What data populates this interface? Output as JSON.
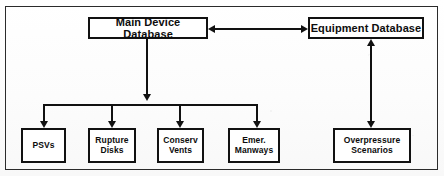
{
  "diagram": {
    "frame_color": "#2b2b2b",
    "line_color": "#111111",
    "background_color": "#fdfdfd",
    "nodes": [
      {
        "id": "main_device_database",
        "label": "Main Device Database"
      },
      {
        "id": "equipment_database",
        "label": "Equipment Database"
      },
      {
        "id": "psvs",
        "label": "PSVs"
      },
      {
        "id": "rupture_disks",
        "label": "Rupture\nDisks"
      },
      {
        "id": "conserv_vents",
        "label": "Conserv\nVents"
      },
      {
        "id": "emer_manways",
        "label": "Emer.\nManways"
      },
      {
        "id": "overpressure_scenarios",
        "label": "Overpressure\nScenarios"
      }
    ],
    "connectors": [
      {
        "id": "main_to_equipment",
        "from": "main_device_database",
        "to": "equipment_database",
        "style": "bidirectional-horizontal"
      },
      {
        "id": "equipment_to_overpressure",
        "from": "equipment_database",
        "to": "overpressure_scenarios",
        "style": "bidirectional-vertical"
      },
      {
        "id": "main_to_bus",
        "from": "main_device_database",
        "to": "distribution-bus",
        "style": "arrow-down"
      },
      {
        "id": "bus_to_psvs",
        "from": "distribution-bus",
        "to": "psvs",
        "style": "arrow-down"
      },
      {
        "id": "bus_to_rupture_disks",
        "from": "distribution-bus",
        "to": "rupture_disks",
        "style": "arrow-down"
      },
      {
        "id": "bus_to_conserv_vents",
        "from": "distribution-bus",
        "to": "conserv_vents",
        "style": "arrow-down"
      },
      {
        "id": "bus_to_emer_manways",
        "from": "distribution-bus",
        "to": "emer_manways",
        "style": "arrow-down"
      }
    ]
  }
}
